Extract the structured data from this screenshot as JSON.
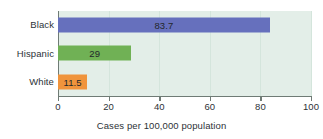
{
  "chart_data": {
    "type": "bar",
    "orientation": "horizontal",
    "title": "",
    "subtitle": "",
    "xlabel": "Cases per 100,000 population",
    "ylabel": "",
    "categories": [
      "Black",
      "Hispanic",
      "White"
    ],
    "values": [
      83.7,
      29,
      11.5
    ],
    "value_labels": [
      "83.7",
      "29",
      "11.5"
    ],
    "bar_colors": [
      "#6670bd",
      "#70b155",
      "#f0943c"
    ],
    "xlim": [
      0,
      100
    ],
    "ylim": null,
    "xticks": [
      0,
      20,
      40,
      60,
      80,
      100
    ],
    "xtick_labels": [
      "0",
      "20",
      "40",
      "60",
      "80",
      "100"
    ],
    "grid": true,
    "grid_axis": "x",
    "legend": false,
    "legend_position": "none",
    "plot_background": "#e3eee8",
    "axis_color": "#6f7b75",
    "text_color": "#2d3237"
  }
}
